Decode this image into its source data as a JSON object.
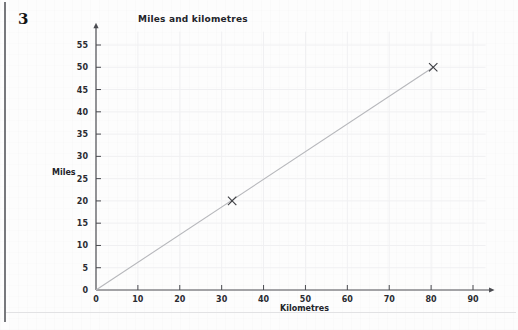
{
  "question": {
    "number": "3"
  },
  "chart_data": {
    "type": "line",
    "title": "Miles and kilometres",
    "xlabel": "Kilometres",
    "ylabel": "Miles",
    "xlim": [
      0,
      93
    ],
    "ylim": [
      0,
      58
    ],
    "xticks": [
      0,
      10,
      20,
      30,
      40,
      50,
      60,
      70,
      80,
      90
    ],
    "xtick_labels": [
      "0",
      "10",
      "20",
      "30",
      "40",
      "50",
      "60",
      "70",
      "80",
      "90"
    ],
    "yticks": [
      0,
      5,
      10,
      15,
      20,
      25,
      30,
      35,
      40,
      45,
      50,
      55
    ],
    "ytick_labels": [
      "0",
      "5",
      "10",
      "15",
      "20",
      "25",
      "30",
      "35",
      "40",
      "45",
      "50",
      "55"
    ],
    "grid": true,
    "legend": "none",
    "series": [
      {
        "name": "conversion line",
        "x": [
          0,
          80.5
        ],
        "y": [
          0,
          50
        ],
        "style": "solid",
        "color": "#b6b7bb"
      }
    ],
    "markers": [
      {
        "label": "marker-x-1",
        "x": 32.5,
        "y": 20,
        "glyph": "x"
      },
      {
        "label": "marker-x-2",
        "x": 80.5,
        "y": 50,
        "glyph": "x"
      }
    ],
    "annotations": []
  },
  "colors": {
    "line": "#b6b7bb",
    "axis": "#4a4b50",
    "grid": "#f0f0f2",
    "text": "#23242a",
    "marker": "#3c3d42",
    "rule": "#77787c"
  }
}
